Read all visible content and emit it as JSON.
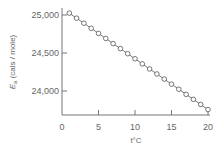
{
  "chart_data": {
    "type": "line",
    "title": "",
    "xlabel": "t°C",
    "ylabel": "E_a (cals / mole)",
    "ylabel_main": "E",
    "ylabel_sub": "a",
    "ylabel_units": "(cals / mole)",
    "xlim": [
      0,
      20
    ],
    "ylim": [
      23680,
      25030
    ],
    "x_ticks": [
      0,
      5,
      10,
      15,
      20
    ],
    "x_tick_labels": [
      "0",
      "5",
      "10",
      "15",
      "20"
    ],
    "y_ticks": [
      24000,
      24500,
      25000
    ],
    "y_tick_labels": [
      "24,000",
      "24,500",
      "25,000"
    ],
    "grid": false,
    "legend": null,
    "marker": "open-circle",
    "values_note": "Endpoints read from the plot (about 25,025 near t=1 and about 23,790 near t=19.5). Intermediate y-values are linearly interpolated, not individually measured.",
    "series": [
      {
        "name": "E_a",
        "x": [
          1,
          2,
          3,
          4,
          5,
          6,
          7,
          8,
          9,
          10,
          11,
          12,
          13,
          14,
          15,
          16,
          17,
          18,
          19,
          20
        ],
        "values": [
          25025,
          24958,
          24892,
          24825,
          24758,
          24691,
          24624,
          24558,
          24491,
          24424,
          24357,
          24290,
          24224,
          24157,
          24090,
          24023,
          23956,
          23890,
          23823,
          23756
        ]
      }
    ]
  }
}
